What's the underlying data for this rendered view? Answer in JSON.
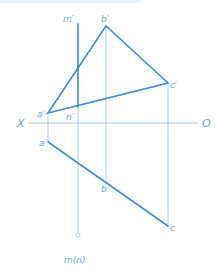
{
  "diagram": {
    "title": "",
    "colors": {
      "thick_line": "#3a8fd6",
      "thin_line": "#8fc3ea",
      "label": "#6aa9dc"
    },
    "axis": {
      "left_label": "X",
      "right_label": "O"
    },
    "points": {
      "a_prime": "a′",
      "b_prime": "b′",
      "c_prime": "c′",
      "m_prime": "m′",
      "n_prime": "n′",
      "a": "a",
      "b": "b",
      "c": "c",
      "mn": "m(n)"
    },
    "elements": [
      "triangle a′b′c′ (frontal projection)",
      "line m′n′ (vertical, frontal projection)",
      "line abc (horizontal projection, collinear)",
      "point m(n) (horizontal projection, coincident)",
      "projection axis X–O"
    ]
  }
}
